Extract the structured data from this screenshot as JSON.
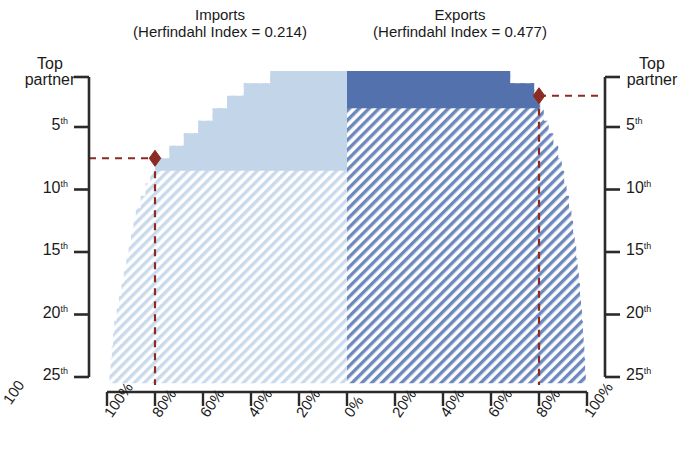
{
  "figure": {
    "background": "#ffffff",
    "axis_color": "#2b2b2b",
    "marker_color": "#8b2b22",
    "imports_solid_color": "#c3d5e9",
    "imports_hatch_color": "#b8cde4",
    "exports_solid_color": "#5372ad",
    "exports_hatch_color": "#5f7cb4"
  },
  "panels": {
    "imports": {
      "title": "Imports",
      "subtitle": "(Herfindahl Index = 0.214)"
    },
    "exports": {
      "title": "Exports",
      "subtitle": "(Herfindahl Index = 0.477)"
    }
  },
  "axes": {
    "left": {
      "title_line1": "Top",
      "title_line2": "partner",
      "ticks": [
        "5",
        "10",
        "15",
        "20",
        "25"
      ],
      "tick_suffix": "th"
    },
    "right": {
      "title_line1": "Top",
      "title_line2": "partner",
      "ticks": [
        "5",
        "10",
        "15",
        "20",
        "25"
      ],
      "tick_suffix": "th"
    },
    "bottom": {
      "left_ticks": [
        "100%",
        "80%",
        "60%",
        "40%",
        "20%",
        "0%"
      ],
      "right_ticks": [
        "20%",
        "40%",
        "60%",
        "80%",
        "100%"
      ],
      "cropped_left_label": "100"
    }
  },
  "markers": {
    "imports": {
      "share": 80,
      "rank": 7
    },
    "exports": {
      "share": 80,
      "rank": 2
    }
  },
  "chart_data": {
    "type": "area",
    "subtitle": "Imports (Herfindahl Index = 0.214) and Exports (Herfindahl Index = 0.477)",
    "xlabel": "Cumulative share of trade (%)",
    "ylabel": "Partner rank",
    "grid": false,
    "legend": "none",
    "orientation": "mirrored-horizontal",
    "xlim_left": [
      100,
      0
    ],
    "xlim_right": [
      0,
      100
    ],
    "ylim": [
      1,
      25
    ],
    "y_categories": [
      1,
      2,
      3,
      4,
      5,
      6,
      7,
      8,
      9,
      10,
      11,
      12,
      13,
      14,
      15,
      16,
      17,
      18,
      19,
      20,
      21,
      22,
      23,
      24,
      25
    ],
    "series": [
      {
        "name": "Imports",
        "side": "left",
        "herfindahl_index": 0.214,
        "units": "cumulative percent",
        "annotation": {
          "rank": 7,
          "share": 80
        },
        "values": [
          32,
          43,
          50,
          56,
          62,
          68,
          74,
          80,
          80,
          80,
          80,
          80,
          80,
          80,
          80,
          80,
          80,
          80,
          80,
          80,
          80,
          80,
          80,
          80,
          80
        ],
        "cumulative_share": [
          32,
          43,
          50,
          56,
          62,
          68,
          74,
          80,
          82,
          84,
          86,
          88,
          89,
          90,
          91,
          92,
          93,
          94,
          95,
          96,
          97,
          97.5,
          98,
          98.5,
          99
        ]
      },
      {
        "name": "Exports",
        "side": "right",
        "herfindahl_index": 0.477,
        "units": "cumulative percent",
        "annotation": {
          "rank": 2,
          "share": 80
        },
        "values": [
          68,
          78,
          80,
          80,
          80,
          80,
          80,
          80,
          80,
          80,
          80,
          80,
          80,
          80,
          80,
          80,
          80,
          80,
          80,
          80,
          80,
          80,
          80,
          80,
          80
        ],
        "cumulative_share": [
          68,
          78,
          80.5,
          82,
          84,
          86,
          88,
          89.5,
          90.5,
          91.5,
          92.5,
          93.5,
          94.2,
          94.9,
          95.5,
          96.1,
          96.6,
          97.1,
          97.5,
          97.9,
          98.3,
          98.6,
          98.9,
          99.2,
          99.5
        ]
      }
    ]
  }
}
